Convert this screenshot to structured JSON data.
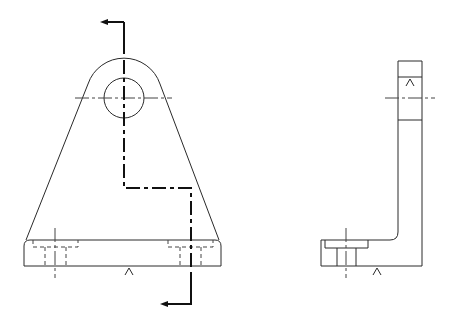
{
  "drawing": {
    "title": "Bracket orthographic views",
    "views": [
      {
        "name": "front-view",
        "description": "Front view with rounded top lug, through hole, tapered sides and base with two counterbored holes; offset section line A-A"
      },
      {
        "name": "side-view",
        "description": "Right side view showing L-shaped bracket profile with counterbored hole in base"
      }
    ],
    "section_line": {
      "type": "offset",
      "arrows": 2
    },
    "surface_marks": 3,
    "colors": {
      "line": "#2a2a2a",
      "background": "#ffffff"
    }
  }
}
